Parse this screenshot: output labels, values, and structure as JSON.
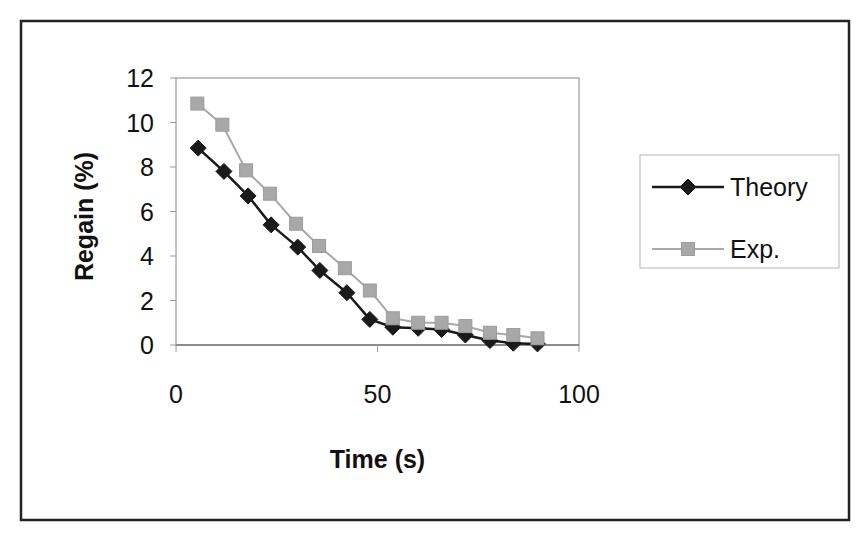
{
  "chart_data": {
    "type": "line",
    "title": "",
    "xlabel": "Time (s)",
    "ylabel": "Regain (%)",
    "xlim": [
      0,
      100
    ],
    "ylim": [
      0,
      12
    ],
    "x_ticks": [
      0,
      50,
      100
    ],
    "y_ticks": [
      0,
      2,
      4,
      6,
      8,
      10,
      12
    ],
    "grid": false,
    "legend_position": "right",
    "series": [
      {
        "name": "Theory",
        "color": "#1a1a1a",
        "marker": "diamond",
        "x": [
          5.5,
          11.9,
          17.9,
          23.6,
          30.2,
          35.7,
          42.4,
          48.1,
          53.8,
          60.1,
          65.9,
          71.8,
          77.9,
          83.7,
          89.7
        ],
        "values": [
          8.85,
          7.8,
          6.7,
          5.4,
          4.4,
          3.35,
          2.35,
          1.15,
          0.8,
          0.75,
          0.7,
          0.45,
          0.2,
          0.08,
          0.05
        ]
      },
      {
        "name": "Exp.",
        "color": "#a8a8a8",
        "marker": "square",
        "x": [
          5.3,
          11.5,
          17.4,
          23.3,
          29.8,
          35.5,
          41.9,
          48.1,
          53.8,
          60.1,
          65.9,
          71.8,
          77.9,
          83.7,
          89.7
        ],
        "values": [
          10.85,
          9.9,
          7.85,
          6.8,
          5.45,
          4.45,
          3.45,
          2.45,
          1.2,
          1.0,
          1.0,
          0.85,
          0.55,
          0.45,
          0.3
        ]
      }
    ]
  },
  "frame": {
    "outer": {
      "x": 21,
      "y": 21,
      "w": 828,
      "h": 499
    },
    "plot": {
      "x": 176,
      "y": 78,
      "w": 403,
      "h": 267
    },
    "legend": {
      "x": 640,
      "y": 155,
      "w": 199,
      "h": 113
    }
  }
}
